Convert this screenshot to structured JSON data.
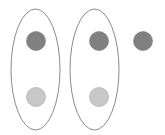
{
  "diagram": {
    "canvas": {
      "width": 165,
      "height": 135,
      "background_color": "#ffffff"
    },
    "palette": {
      "dark_node_fill": "#808080",
      "dark_node_stroke": "#787878",
      "light_node_fill": "#c8c8c8",
      "light_node_stroke": "#b4b4b4",
      "ellipse_stroke": "#8a8a8a"
    },
    "groups": [
      {
        "id": "group-left",
        "label": "left-set",
        "cx": 35.5,
        "cy": 69.5,
        "rx": 24.5,
        "ry": 60.5,
        "stroke_width": 1
      },
      {
        "id": "group-right",
        "label": "right-set",
        "cx": 94.5,
        "cy": 69.5,
        "rx": 24.5,
        "ry": 60.5,
        "stroke_width": 1
      }
    ],
    "nodes": [
      {
        "id": "node-left-top",
        "label": "dark-dot-left-top",
        "kind": "dark",
        "cx": 36,
        "cy": 41,
        "r": 9.5,
        "in_group": "group-left"
      },
      {
        "id": "node-left-bottom",
        "label": "light-dot-left-bottom",
        "kind": "light",
        "cx": 36,
        "cy": 97,
        "r": 9.5,
        "in_group": "group-left"
      },
      {
        "id": "node-right-top",
        "label": "dark-dot-right-top",
        "kind": "dark",
        "cx": 99,
        "cy": 41,
        "r": 9.5,
        "in_group": "group-right"
      },
      {
        "id": "node-right-bottom",
        "label": "light-dot-right-bottom",
        "kind": "light",
        "cx": 99,
        "cy": 97,
        "r": 9.5,
        "in_group": "group-right"
      },
      {
        "id": "node-outside",
        "label": "dark-dot-outside",
        "kind": "dark",
        "cx": 143,
        "cy": 41,
        "r": 9.5,
        "in_group": null
      }
    ]
  }
}
